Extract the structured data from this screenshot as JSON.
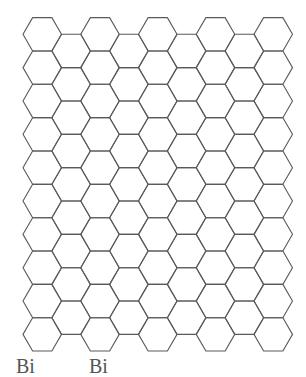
{
  "diagram": {
    "type": "hexagonal-grid",
    "orientation": "flat-top",
    "background": "#ffffff",
    "stroke_color": "#5a5a5a",
    "stroke_width": 1.1,
    "hex_radius": 19.25,
    "origin_center_x": 42.25,
    "origin_center_y": 34.3,
    "columns": 9,
    "even_column_rows": 10,
    "odd_column_rows": 9
  },
  "captions": {
    "left": "Bi",
    "right": "Bi"
  }
}
